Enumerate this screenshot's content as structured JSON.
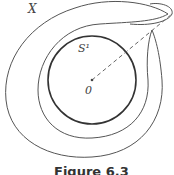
{
  "figure": {
    "labels": {
      "space": "X",
      "circle": "S¹",
      "center": "0"
    },
    "caption": "Figure 6.3"
  },
  "colors": {
    "stroke": "#555555",
    "circle_stroke": "#333333",
    "dash": "#666666"
  }
}
